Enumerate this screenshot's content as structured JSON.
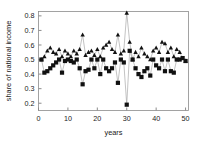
{
  "chart_data": {
    "type": "line",
    "title": "",
    "subtitle": "",
    "xlabel": "years",
    "ylabel": "share of national income",
    "xlim": [
      0,
      51
    ],
    "ylim": [
      0.15,
      0.83
    ],
    "xticks": [
      0,
      10,
      20,
      30,
      40,
      50
    ],
    "xtick_labels": [
      "0",
      "10",
      "20",
      "30",
      "40",
      "50"
    ],
    "yticks": [
      0.2,
      0.3,
      0.4,
      0.5,
      0.6,
      0.7,
      0.8
    ],
    "ytick_labels": [
      "0.2",
      "0.3",
      "0.4",
      "0.5",
      "0.6",
      "0.7",
      "0.8"
    ],
    "grid": false,
    "legend": "none",
    "annotations": [
      "sharp divergence spike at year 30: upper series peaks at 0.82 while lower series drops to 0.19",
      "lower series dips to 0.33 at year 15 and 0.34 at year 27",
      "both series converge near 0.50 toward year 50"
    ],
    "x": [
      1,
      2,
      3,
      4,
      5,
      6,
      7,
      8,
      9,
      10,
      11,
      12,
      13,
      14,
      15,
      16,
      17,
      18,
      19,
      20,
      21,
      22,
      23,
      24,
      25,
      26,
      27,
      28,
      29,
      30,
      31,
      32,
      33,
      34,
      35,
      36,
      37,
      38,
      39,
      40,
      41,
      42,
      43,
      44,
      45,
      46,
      47,
      48,
      49,
      50
    ],
    "series": [
      {
        "name": "upper-series",
        "marker": "triangle",
        "color": "#111111",
        "values": [
          0.5,
          0.52,
          0.56,
          0.58,
          0.55,
          0.54,
          0.57,
          0.52,
          0.56,
          0.54,
          0.52,
          0.56,
          0.54,
          0.57,
          0.67,
          0.53,
          0.55,
          0.56,
          0.53,
          0.57,
          0.52,
          0.58,
          0.6,
          0.62,
          0.57,
          0.55,
          0.67,
          0.54,
          0.56,
          0.82,
          0.62,
          0.5,
          0.55,
          0.52,
          0.58,
          0.54,
          0.52,
          0.5,
          0.56,
          0.58,
          0.55,
          0.62,
          0.61,
          0.55,
          0.58,
          0.52,
          0.57,
          0.55,
          0.51,
          0.49
        ]
      },
      {
        "name": "lower-series",
        "marker": "square",
        "color": "#111111",
        "values": [
          0.5,
          0.41,
          0.42,
          0.44,
          0.46,
          0.48,
          0.5,
          0.41,
          0.49,
          0.5,
          0.49,
          0.48,
          0.5,
          0.44,
          0.33,
          0.42,
          0.43,
          0.5,
          0.44,
          0.5,
          0.4,
          0.5,
          0.44,
          0.42,
          0.44,
          0.48,
          0.34,
          0.5,
          0.48,
          0.19,
          0.56,
          0.5,
          0.44,
          0.4,
          0.38,
          0.42,
          0.44,
          0.39,
          0.5,
          0.46,
          0.44,
          0.5,
          0.42,
          0.5,
          0.42,
          0.41,
          0.5,
          0.5,
          0.51,
          0.49
        ]
      }
    ]
  }
}
